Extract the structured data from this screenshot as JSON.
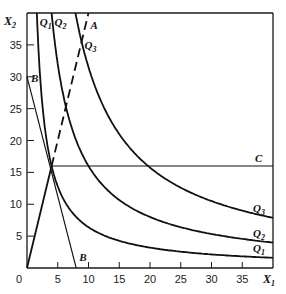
{
  "chart_data": {
    "type": "line",
    "title": "",
    "xlabel": "X",
    "xlabel_sub": "1",
    "ylabel": "X",
    "ylabel_sub": "2",
    "xlim": [
      0,
      40
    ],
    "ylim": [
      0,
      40
    ],
    "grid": false,
    "x_ticks": [
      5,
      10,
      15,
      20,
      25,
      30,
      35
    ],
    "y_ticks": [
      5,
      10,
      15,
      20,
      25,
      30,
      35
    ],
    "origin_label": "0",
    "series": [
      {
        "name": "Q1",
        "kind": "isoquant",
        "k": 64,
        "style": "solid",
        "labels": [
          {
            "text": "Q",
            "sub": "1",
            "at": "top"
          },
          {
            "text": "Q",
            "sub": "1",
            "at": "right"
          }
        ]
      },
      {
        "name": "Q2",
        "kind": "isoquant",
        "k": 160,
        "style": "solid",
        "labels": [
          {
            "text": "Q",
            "sub": "2",
            "at": "top"
          },
          {
            "text": "Q",
            "sub": "2",
            "at": "right"
          }
        ]
      },
      {
        "name": "Q3",
        "kind": "isoquant",
        "k": 315,
        "style": "solid",
        "labels": [
          {
            "text": "Q",
            "sub": "3",
            "at": "top"
          },
          {
            "text": "Q",
            "sub": "3",
            "at": "right"
          }
        ]
      },
      {
        "name": "A",
        "kind": "line",
        "points": [
          [
            0,
            0
          ],
          [
            10,
            40
          ]
        ],
        "style": "dashed-above-16",
        "label": "A"
      },
      {
        "name": "B",
        "kind": "line",
        "points": [
          [
            0,
            30
          ],
          [
            8,
            0
          ]
        ],
        "style": "thin",
        "label": "B"
      },
      {
        "name": "C",
        "kind": "line",
        "points": [
          [
            4,
            16
          ],
          [
            40,
            16
          ]
        ],
        "style": "thin",
        "label": "C"
      }
    ],
    "tangency_point": [
      4,
      16
    ]
  }
}
